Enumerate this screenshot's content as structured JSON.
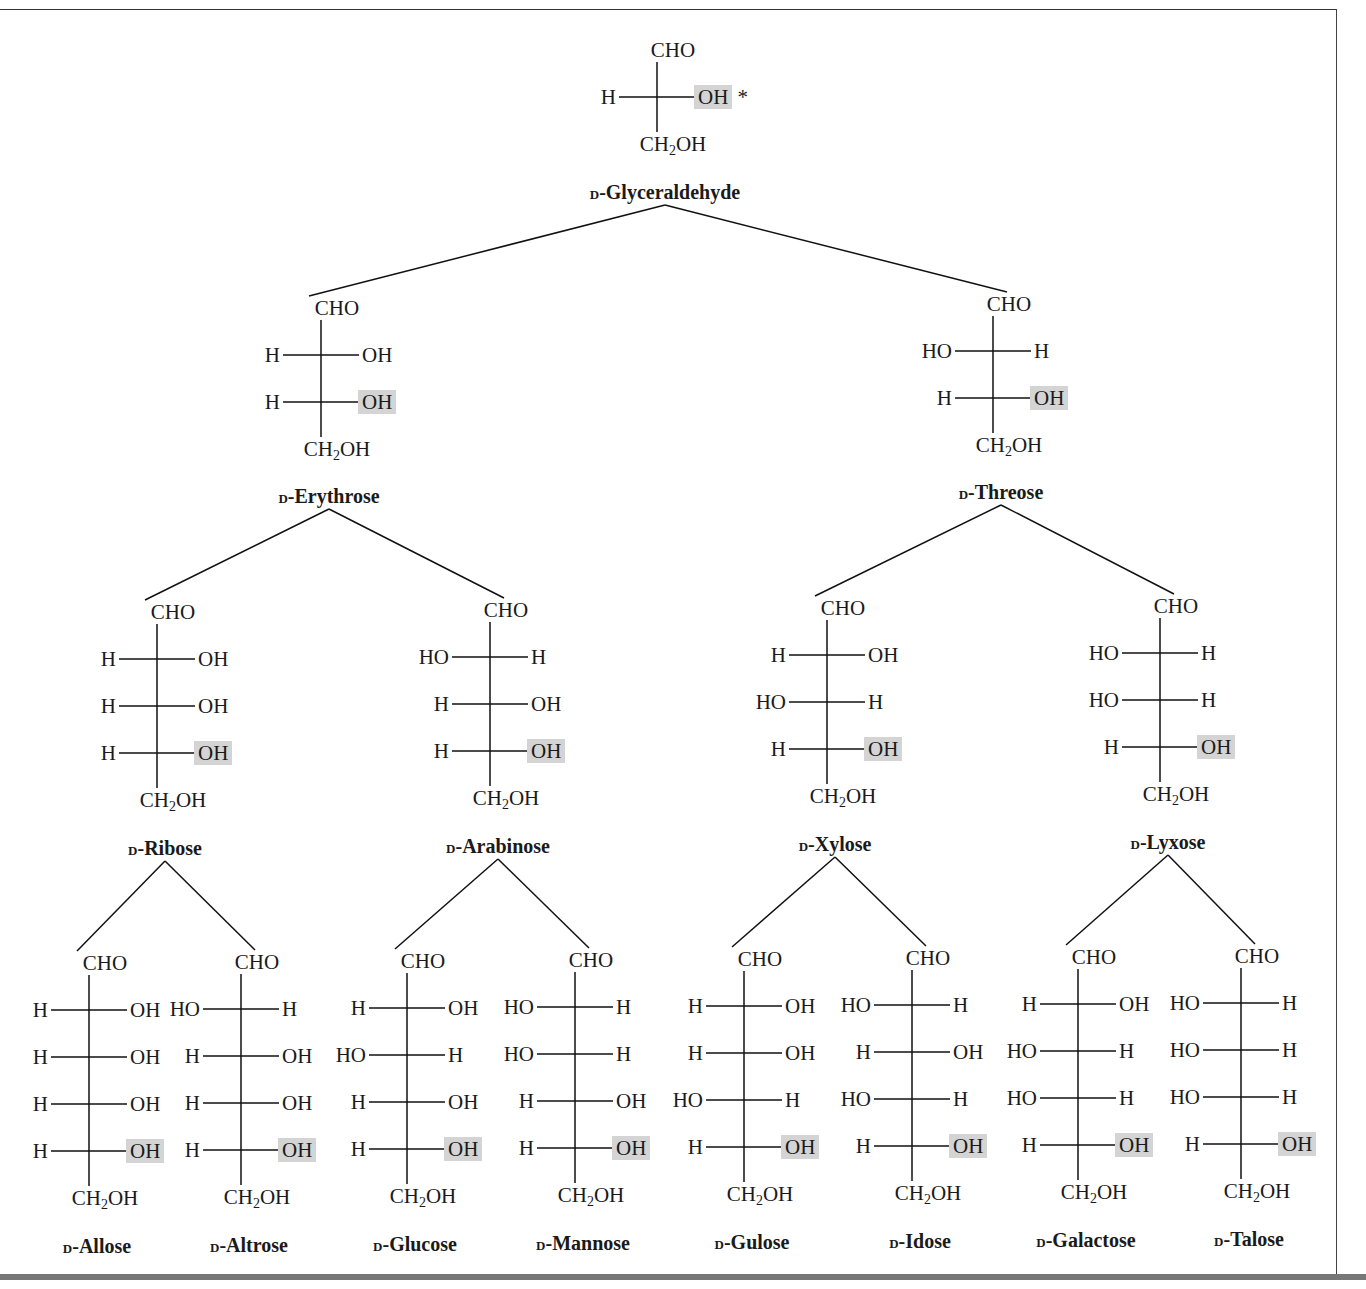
{
  "figure": {
    "highlight_color": "#d4d4d4",
    "chiral_marker": "*",
    "top_group": "CHO",
    "bottom_group": "CH2OH"
  },
  "molecules": [
    {
      "id": "glyceraldehyde",
      "prefix": "D",
      "name": "Glyceraldehyde",
      "label": "D-Glyceraldehyde",
      "level": 3,
      "rows": [
        [
          "H",
          "OH"
        ]
      ]
    },
    {
      "id": "erythrose",
      "prefix": "D",
      "name": "Erythrose",
      "label": "D-Erythrose",
      "level": 4,
      "rows": [
        [
          "H",
          "OH"
        ],
        [
          "H",
          "OH"
        ]
      ]
    },
    {
      "id": "threose",
      "prefix": "D",
      "name": "Threose",
      "label": "D-Threose",
      "level": 4,
      "rows": [
        [
          "HO",
          "H"
        ],
        [
          "H",
          "OH"
        ]
      ]
    },
    {
      "id": "ribose",
      "prefix": "D",
      "name": "Ribose",
      "label": "D-Ribose",
      "level": 5,
      "rows": [
        [
          "H",
          "OH"
        ],
        [
          "H",
          "OH"
        ],
        [
          "H",
          "OH"
        ]
      ]
    },
    {
      "id": "arabinose",
      "prefix": "D",
      "name": "Arabinose",
      "label": "D-Arabinose",
      "level": 5,
      "rows": [
        [
          "HO",
          "H"
        ],
        [
          "H",
          "OH"
        ],
        [
          "H",
          "OH"
        ]
      ]
    },
    {
      "id": "xylose",
      "prefix": "D",
      "name": "Xylose",
      "label": "D-Xylose",
      "level": 5,
      "rows": [
        [
          "H",
          "OH"
        ],
        [
          "HO",
          "H"
        ],
        [
          "H",
          "OH"
        ]
      ]
    },
    {
      "id": "lyxose",
      "prefix": "D",
      "name": "Lyxose",
      "label": "D-Lyxose",
      "level": 5,
      "rows": [
        [
          "HO",
          "H"
        ],
        [
          "HO",
          "H"
        ],
        [
          "H",
          "OH"
        ]
      ]
    },
    {
      "id": "allose",
      "prefix": "D",
      "name": "Allose",
      "label": "D-Allose",
      "level": 6,
      "rows": [
        [
          "H",
          "OH"
        ],
        [
          "H",
          "OH"
        ],
        [
          "H",
          "OH"
        ],
        [
          "H",
          "OH"
        ]
      ]
    },
    {
      "id": "altrose",
      "prefix": "D",
      "name": "Altrose",
      "label": "D-Altrose",
      "level": 6,
      "rows": [
        [
          "HO",
          "H"
        ],
        [
          "H",
          "OH"
        ],
        [
          "H",
          "OH"
        ],
        [
          "H",
          "OH"
        ]
      ]
    },
    {
      "id": "glucose",
      "prefix": "D",
      "name": "Glucose",
      "label": "D-Glucose",
      "level": 6,
      "rows": [
        [
          "H",
          "OH"
        ],
        [
          "HO",
          "H"
        ],
        [
          "H",
          "OH"
        ],
        [
          "H",
          "OH"
        ]
      ]
    },
    {
      "id": "mannose",
      "prefix": "D",
      "name": "Mannose",
      "label": "D-Mannose",
      "level": 6,
      "rows": [
        [
          "HO",
          "H"
        ],
        [
          "HO",
          "H"
        ],
        [
          "H",
          "OH"
        ],
        [
          "H",
          "OH"
        ]
      ]
    },
    {
      "id": "gulose",
      "prefix": "D",
      "name": "Gulose",
      "label": "D-Gulose",
      "level": 6,
      "rows": [
        [
          "H",
          "OH"
        ],
        [
          "H",
          "OH"
        ],
        [
          "HO",
          "H"
        ],
        [
          "H",
          "OH"
        ]
      ]
    },
    {
      "id": "idose",
      "prefix": "D",
      "name": "Idose",
      "label": "D-Idose",
      "level": 6,
      "rows": [
        [
          "HO",
          "H"
        ],
        [
          "H",
          "OH"
        ],
        [
          "HO",
          "H"
        ],
        [
          "H",
          "OH"
        ]
      ]
    },
    {
      "id": "galactose",
      "prefix": "D",
      "name": "Galactose",
      "label": "D-Galactose",
      "level": 6,
      "rows": [
        [
          "H",
          "OH"
        ],
        [
          "HO",
          "H"
        ],
        [
          "HO",
          "H"
        ],
        [
          "H",
          "OH"
        ]
      ]
    },
    {
      "id": "talose",
      "prefix": "D",
      "name": "Talose",
      "label": "D-Talose",
      "level": 6,
      "rows": [
        [
          "HO",
          "H"
        ],
        [
          "HO",
          "H"
        ],
        [
          "HO",
          "H"
        ],
        [
          "H",
          "OH"
        ]
      ]
    }
  ],
  "tree": [
    [
      "glyceraldehyde",
      "erythrose"
    ],
    [
      "glyceraldehyde",
      "threose"
    ],
    [
      "erythrose",
      "ribose"
    ],
    [
      "erythrose",
      "arabinose"
    ],
    [
      "threose",
      "xylose"
    ],
    [
      "threose",
      "lyxose"
    ],
    [
      "ribose",
      "allose"
    ],
    [
      "ribose",
      "altrose"
    ],
    [
      "arabinose",
      "glucose"
    ],
    [
      "arabinose",
      "mannose"
    ],
    [
      "xylose",
      "gulose"
    ],
    [
      "xylose",
      "idose"
    ],
    [
      "lyxose",
      "galactose"
    ],
    [
      "lyxose",
      "talose"
    ]
  ]
}
